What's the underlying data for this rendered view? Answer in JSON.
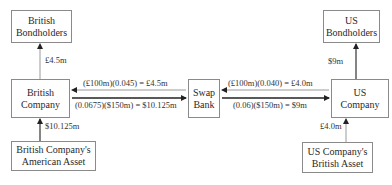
{
  "nodes": {
    "british_bondholders": {
      "line1": "British",
      "line2": "Bondholders"
    },
    "british_company": {
      "line1": "British",
      "line2": "Company"
    },
    "swap_bank": {
      "line1": "Swap",
      "line2": "Bank"
    },
    "us_company": {
      "line1": "US",
      "line2": "Company"
    },
    "us_bondholders": {
      "line1": "US",
      "line2": "Bondholders"
    },
    "british_asset_us": {
      "line1": "British Company's",
      "line2": "American Asset"
    },
    "us_asset_british": {
      "line1": "US Company's",
      "line2": "British Asset"
    }
  },
  "edges": {
    "bc_to_bbh": "£4.5m",
    "asset_to_bc": "$10.125m",
    "swap_to_bc": "(£100m)(0.045) = £4.5m",
    "bc_to_swap": "(0.0675)($150m) = $10.125m",
    "usc_to_swap": "(£100m)(0.040) = £4.0m",
    "swap_to_usc": "(0.06)($150m) = $9m",
    "usc_to_usbh": "$9m",
    "asset_to_usc": "£4.0m"
  },
  "colors": {
    "line": "#333333",
    "arrow_light": "#888888",
    "border": "#8a8a8a"
  }
}
